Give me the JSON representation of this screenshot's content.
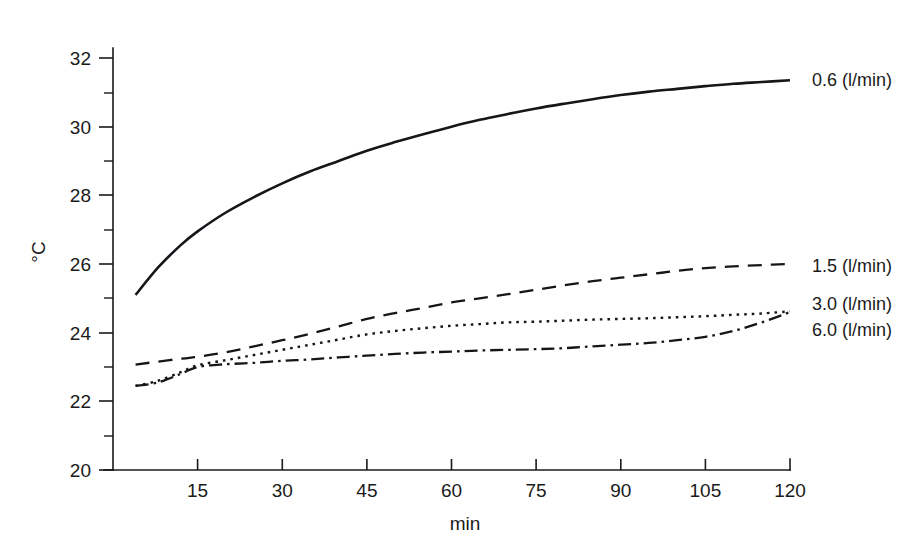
{
  "chart_data": {
    "type": "line",
    "title": "",
    "xlabel": "min",
    "ylabel": "°C",
    "xlim": [
      0,
      120
    ],
    "ylim": [
      20,
      32
    ],
    "grid": false,
    "legend_position": "right-inline-end-of-line",
    "x_ticks": [
      15,
      30,
      45,
      60,
      75,
      90,
      105,
      120
    ],
    "x_tick_labels": [
      "15",
      "30",
      "45",
      "60",
      "75",
      "90",
      "105",
      "120"
    ],
    "x_minor_tick_interval": 15,
    "y_ticks": [
      20,
      22,
      24,
      26,
      28,
      30,
      32
    ],
    "y_tick_labels": [
      "20",
      "22",
      "24",
      "26",
      "28",
      "30",
      "32"
    ],
    "y_minor_ticks": [
      21,
      23,
      25,
      27,
      29,
      31
    ],
    "series": [
      {
        "name": "0.6 (l/min)",
        "label": "0.6 (l/min)",
        "style": "solid",
        "dash": "none",
        "stroke_width": 2.6,
        "color": "#15161a",
        "x": [
          4,
          8,
          12,
          15,
          20,
          25,
          30,
          35,
          40,
          45,
          50,
          55,
          60,
          65,
          70,
          75,
          80,
          85,
          90,
          95,
          100,
          105,
          110,
          115,
          120
        ],
        "y": [
          25.1,
          25.9,
          26.55,
          26.95,
          27.5,
          27.95,
          28.35,
          28.7,
          29.0,
          29.3,
          29.55,
          29.78,
          30.0,
          30.2,
          30.37,
          30.53,
          30.67,
          30.8,
          30.92,
          31.02,
          31.1,
          31.18,
          31.25,
          31.3,
          31.35
        ]
      },
      {
        "name": "1.5 (l/min)",
        "label": "1.5 (l/min)",
        "style": "dashed",
        "dash": "14,9",
        "stroke_width": 2.3,
        "color": "#15161a",
        "x": [
          4,
          10,
          15,
          20,
          25,
          30,
          35,
          40,
          45,
          50,
          55,
          60,
          65,
          70,
          75,
          80,
          85,
          90,
          95,
          100,
          105,
          110,
          115,
          120
        ],
        "y": [
          23.07,
          23.2,
          23.3,
          23.43,
          23.6,
          23.78,
          23.97,
          24.18,
          24.4,
          24.57,
          24.72,
          24.88,
          25.0,
          25.12,
          25.25,
          25.38,
          25.5,
          25.6,
          25.7,
          25.8,
          25.88,
          25.93,
          25.97,
          26.0
        ]
      },
      {
        "name": "3.0 (l/min)",
        "label": "3.0 (l/min)",
        "style": "dotted",
        "dash": "2.6,5",
        "stroke_width": 2.4,
        "color": "#15161a",
        "x": [
          4,
          8,
          12,
          15,
          20,
          25,
          30,
          35,
          40,
          45,
          50,
          55,
          60,
          65,
          70,
          75,
          80,
          85,
          90,
          95,
          100,
          105,
          110,
          115,
          120
        ],
        "y": [
          22.45,
          22.6,
          22.85,
          23.05,
          23.2,
          23.35,
          23.5,
          23.65,
          23.8,
          23.95,
          24.05,
          24.13,
          24.2,
          24.25,
          24.3,
          24.32,
          24.35,
          24.38,
          24.4,
          24.42,
          24.45,
          24.48,
          24.52,
          24.56,
          24.62
        ]
      },
      {
        "name": "6.0 (l/min)",
        "label": "6.0 (l/min)",
        "style": "dash-dot",
        "dash": "13,5,2.6,5",
        "stroke_width": 2.3,
        "color": "#15161a",
        "x": [
          4,
          8,
          12,
          15,
          20,
          25,
          30,
          35,
          40,
          45,
          50,
          55,
          60,
          65,
          70,
          75,
          80,
          85,
          90,
          95,
          100,
          105,
          110,
          115,
          120
        ],
        "y": [
          22.45,
          22.55,
          22.8,
          23.0,
          23.08,
          23.12,
          23.18,
          23.22,
          23.28,
          23.33,
          23.38,
          23.42,
          23.45,
          23.48,
          23.5,
          23.52,
          23.55,
          23.6,
          23.65,
          23.7,
          23.78,
          23.88,
          24.05,
          24.3,
          24.6
        ]
      }
    ]
  },
  "labels": {
    "y_axis_title": "°C",
    "x_axis_title": "min",
    "series_0": "0.6 (l/min)",
    "series_1": "1.5 (l/min)",
    "series_2": "3.0 (l/min)",
    "series_3": "6.0 (l/min)",
    "y_20": "20",
    "y_22": "22",
    "y_24": "24",
    "y_26": "26",
    "y_28": "28",
    "y_30": "30",
    "y_32": "32",
    "x_15": "15",
    "x_30": "30",
    "x_45": "45",
    "x_60": "60",
    "x_75": "75",
    "x_90": "90",
    "x_105": "105",
    "x_120": "120"
  },
  "colors": {
    "ink": "#15161a",
    "background": "#ffffff"
  }
}
